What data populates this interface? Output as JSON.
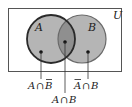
{
  "diagram": {
    "type": "venn",
    "universe": {
      "label": "U"
    },
    "sets": [
      {
        "id": "A",
        "label": "A"
      },
      {
        "id": "B",
        "label": "B"
      }
    ],
    "regions": [
      {
        "id": "a-only",
        "set_a": "A",
        "op": "∩",
        "set_b": "B",
        "negate": "B",
        "label": "A ∩ B̄"
      },
      {
        "id": "intersection",
        "set_a": "A",
        "op": "∩",
        "set_b": "B",
        "negate": "",
        "label": "A ∩ B"
      },
      {
        "id": "b-only",
        "set_a": "A",
        "op": "∩",
        "set_b": "B",
        "negate": "A",
        "label": "Ā ∩ B"
      }
    ],
    "colors": {
      "border": "#555555",
      "circle_fill": "#b5b5b5",
      "overlap_fill": "#8f8f8f",
      "circle_a_stroke": "#2a2a2a",
      "circle_b_stroke": "#6a6a6a",
      "text": "#222222"
    }
  }
}
